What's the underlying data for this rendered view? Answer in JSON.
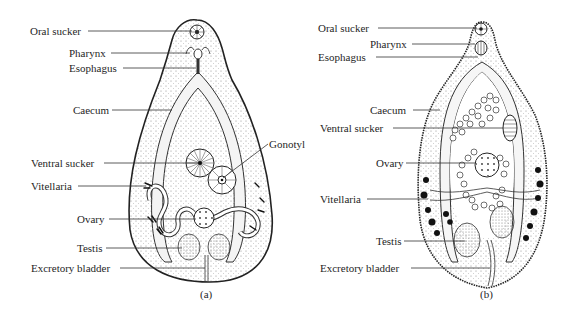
{
  "figure": {
    "panel_a": {
      "caption": "(a)",
      "labels": {
        "oral_sucker": "Oral sucker",
        "pharynx": "Pharynx",
        "esophagus": "Esophagus",
        "caecum": "Caecum",
        "ventral_sucker": "Ventral sucker",
        "gonotyl": "Gonotyl",
        "vitellaria": "Vitellaria",
        "ovary": "Ovary",
        "testis": "Testis",
        "excretory_bladder": "Excretory bladder"
      }
    },
    "panel_b": {
      "caption": "(b)",
      "labels": {
        "oral_sucker": "Oral sucker",
        "pharynx": "Pharynx",
        "esophagus": "Esophagus",
        "caecum": "Caecum",
        "ventral_sucker": "Ventral sucker",
        "ovary": "Ovary",
        "vitellaria": "Vitellaria",
        "testis": "Testis",
        "excretory_bladder": "Excretory bladder"
      }
    }
  }
}
